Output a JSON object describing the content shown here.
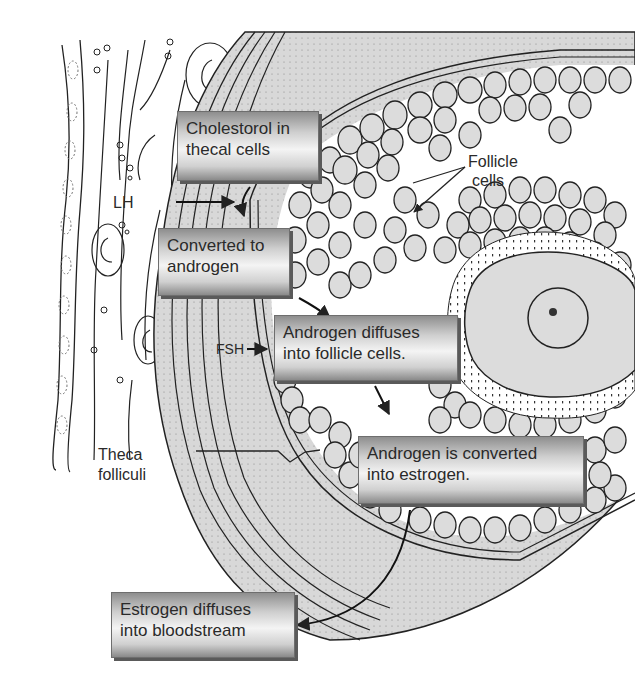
{
  "diagram": {
    "steps": [
      {
        "line1": "Cholestorol in",
        "line2": "thecal cells"
      },
      {
        "line1": "Converted to",
        "line2": "androgen"
      },
      {
        "line1": "Androgen diffuses",
        "line2": "into follicle cells."
      },
      {
        "line1": "Androgen is converted",
        "line2": "into estrogen."
      },
      {
        "line1": "Estrogen diffuses",
        "line2": "into bloodstream"
      }
    ],
    "labels": {
      "lh": "LH",
      "fsh": "FSH",
      "follicle_cells_1": "Follicle",
      "follicle_cells_2": "cells",
      "theca_1": "Theca",
      "theca_2": "folliculi"
    },
    "colors": {
      "box_mid": "#f4f4f4",
      "box_edge": "#8a8a8a",
      "theca_fill": "#d6d6d6",
      "cell_fill": "#dcdcdc",
      "ink": "#222222"
    }
  }
}
